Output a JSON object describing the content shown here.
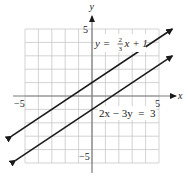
{
  "chart_data": {
    "type": "line",
    "title": "",
    "xlabel": "x",
    "ylabel": "y",
    "xlim": [
      -5,
      5
    ],
    "ylim": [
      -5,
      5
    ],
    "grid": true,
    "tick_labels": {
      "x_left": "−5",
      "x_right": "5",
      "y_top": "5",
      "y_bottom": "−5"
    },
    "series": [
      {
        "name": "y = 2/3 x + 1",
        "equation": "y = (2/3)x + 1",
        "slope": 0.6667,
        "intercept": 1,
        "x": [
          -6,
          6
        ],
        "y": [
          -3,
          5
        ],
        "arrows_both_ends": true
      },
      {
        "name": "2x − 3y = 3",
        "equation": "2x - 3y = 3",
        "slope": 0.6667,
        "intercept": -1,
        "x": [
          -5.7,
          6
        ],
        "y": [
          -4.8,
          3
        ],
        "arrows_both_ends": true
      }
    ],
    "annotations": [
      {
        "text_parts": [
          "y = ",
          "2",
          "3",
          "x + 1"
        ],
        "near": "upper line, right of y-axis near y=4"
      },
      {
        "text": "2x − 3y = 3",
        "near": "lower line, below x-axis right side"
      }
    ]
  },
  "labels": {
    "x_axis": "x",
    "y_axis": "y",
    "x_min": "−5",
    "x_max": "5",
    "y_max": "5",
    "y_min": "−5",
    "eq1_prefix": "y =",
    "eq1_num": "2",
    "eq1_den": "3",
    "eq1_suffix": "x + 1",
    "eq2": "2x − 3y  =  3"
  },
  "colors": {
    "grid": "#c8c8c8",
    "axis": "#7a7a7a",
    "line": "#1a1a1a",
    "text": "#222222"
  }
}
